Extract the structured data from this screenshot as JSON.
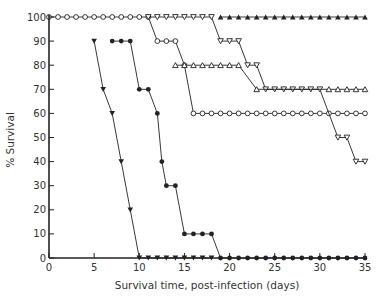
{
  "chart_data": {
    "type": "line",
    "title": "",
    "xlabel": "Survival time, post-infection (days)",
    "ylabel": "% Survival",
    "xlim": [
      0,
      35
    ],
    "ylim": [
      0,
      100
    ],
    "xticks": [
      0,
      5,
      10,
      15,
      20,
      25,
      30,
      35
    ],
    "yticks": [
      0,
      10,
      20,
      30,
      40,
      50,
      60,
      70,
      80,
      90,
      100
    ],
    "grid": false,
    "legend": null,
    "series": [
      {
        "name": "filled-triangle-down",
        "marker": "filled-triangle-down",
        "points": [
          [
            5,
            90
          ],
          [
            6,
            70
          ],
          [
            7,
            60
          ],
          [
            8,
            40
          ],
          [
            9,
            20
          ],
          [
            10,
            0
          ],
          [
            11,
            0
          ],
          [
            12,
            0
          ],
          [
            13,
            0
          ],
          [
            14,
            0
          ],
          [
            15,
            0
          ],
          [
            16,
            0
          ],
          [
            17,
            0
          ],
          [
            18,
            0
          ]
        ]
      },
      {
        "name": "filled-circle",
        "marker": "filled-circle",
        "points": [
          [
            7,
            90
          ],
          [
            8,
            90
          ],
          [
            9,
            90
          ],
          [
            10,
            70
          ],
          [
            11,
            70
          ],
          [
            12,
            60
          ],
          [
            12.5,
            40
          ],
          [
            13,
            30
          ],
          [
            14,
            30
          ],
          [
            15,
            10
          ],
          [
            16,
            10
          ],
          [
            17,
            10
          ],
          [
            18,
            10
          ],
          [
            19,
            0
          ],
          [
            20,
            0
          ],
          [
            21,
            0
          ],
          [
            22,
            0
          ],
          [
            23,
            0
          ],
          [
            24,
            0
          ],
          [
            25,
            0
          ],
          [
            26,
            0
          ],
          [
            27,
            0
          ],
          [
            28,
            0
          ],
          [
            29,
            0
          ],
          [
            30,
            0
          ],
          [
            31,
            0
          ],
          [
            32,
            0
          ],
          [
            33,
            0
          ],
          [
            34,
            0
          ],
          [
            35,
            0
          ]
        ]
      },
      {
        "name": "open-circle",
        "marker": "open-circle",
        "points": [
          [
            0,
            100
          ],
          [
            1,
            100
          ],
          [
            2,
            100
          ],
          [
            3,
            100
          ],
          [
            4,
            100
          ],
          [
            5,
            100
          ],
          [
            6,
            100
          ],
          [
            7,
            100
          ],
          [
            8,
            100
          ],
          [
            9,
            100
          ],
          [
            10,
            100
          ],
          [
            11,
            100
          ],
          [
            12,
            90
          ],
          [
            13,
            90
          ],
          [
            14,
            90
          ],
          [
            15,
            80
          ],
          [
            16,
            60
          ],
          [
            17,
            60
          ],
          [
            18,
            60
          ],
          [
            19,
            60
          ],
          [
            20,
            60
          ],
          [
            21,
            60
          ],
          [
            22,
            60
          ],
          [
            23,
            60
          ],
          [
            24,
            60
          ],
          [
            25,
            60
          ],
          [
            26,
            60
          ],
          [
            27,
            60
          ],
          [
            28,
            60
          ],
          [
            29,
            60
          ],
          [
            30,
            60
          ],
          [
            31,
            60
          ],
          [
            32,
            60
          ],
          [
            33,
            60
          ],
          [
            34,
            60
          ],
          [
            35,
            60
          ]
        ]
      },
      {
        "name": "open-triangle-down",
        "marker": "open-triangle-down",
        "points": [
          [
            11,
            100
          ],
          [
            12,
            100
          ],
          [
            13,
            100
          ],
          [
            14,
            100
          ],
          [
            15,
            100
          ],
          [
            16,
            100
          ],
          [
            17,
            100
          ],
          [
            18,
            100
          ],
          [
            19,
            90
          ],
          [
            20,
            90
          ],
          [
            21,
            90
          ],
          [
            22,
            80
          ],
          [
            23,
            80
          ],
          [
            24,
            70
          ],
          [
            25,
            70
          ],
          [
            26,
            70
          ],
          [
            27,
            70
          ],
          [
            28,
            70
          ],
          [
            29,
            70
          ],
          [
            30,
            70
          ],
          [
            32,
            50
          ],
          [
            33,
            50
          ],
          [
            34,
            40
          ],
          [
            35,
            40
          ]
        ]
      },
      {
        "name": "open-triangle-up",
        "marker": "open-triangle-up",
        "points": [
          [
            14,
            80
          ],
          [
            15,
            80
          ],
          [
            16,
            80
          ],
          [
            17,
            80
          ],
          [
            18,
            80
          ],
          [
            19,
            80
          ],
          [
            20,
            80
          ],
          [
            21,
            80
          ],
          [
            23,
            70
          ],
          [
            31,
            70
          ],
          [
            32,
            70
          ],
          [
            33,
            70
          ],
          [
            34,
            70
          ],
          [
            35,
            70
          ]
        ]
      },
      {
        "name": "filled-triangle-up",
        "marker": "filled-triangle-up",
        "points": [
          [
            19,
            100
          ],
          [
            20,
            100
          ],
          [
            21,
            100
          ],
          [
            22,
            100
          ],
          [
            23,
            100
          ],
          [
            24,
            100
          ],
          [
            25,
            100
          ],
          [
            26,
            100
          ],
          [
            27,
            100
          ],
          [
            28,
            100
          ],
          [
            29,
            100
          ],
          [
            30,
            100
          ],
          [
            31,
            100
          ],
          [
            32,
            100
          ],
          [
            33,
            100
          ],
          [
            34,
            100
          ],
          [
            35,
            100
          ]
        ]
      }
    ]
  },
  "axes": {
    "x_title": "Survival time, post-infection (days)",
    "y_title": "% Survival"
  }
}
